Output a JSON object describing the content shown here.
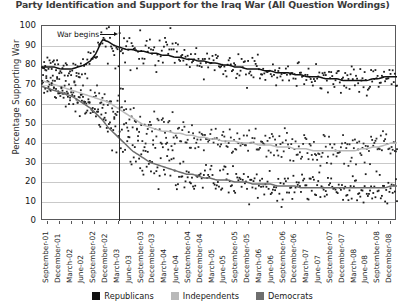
{
  "chart_data": {
    "type": "scatter",
    "title": "Party Identification and Support for the Iraq War (All Question Wordings)",
    "xlabel": "",
    "ylabel": "Percentage Supporting War",
    "ylim": [
      0,
      100
    ],
    "ytick_values": [
      0,
      10,
      20,
      30,
      40,
      50,
      60,
      70,
      80,
      90,
      100
    ],
    "grid": true,
    "legend_position": "bottom",
    "annotations": [
      {
        "text": "War begins",
        "x": "March-03",
        "note": "vertical line at March 2003 with left-pointing arrow label"
      }
    ],
    "xtick_labels": [
      "September-01",
      "December-01",
      "March-02",
      "June-02",
      "September-02",
      "December-02",
      "March-03",
      "June-03",
      "September-03",
      "December-03",
      "March-04",
      "June-04",
      "September-04",
      "December-04",
      "March-05",
      "June-05",
      "September-05",
      "December-05",
      "March-06",
      "June-06",
      "September-06",
      "December-06",
      "March-07",
      "June-07",
      "September-07",
      "December-07",
      "March-08",
      "June-08",
      "September-08",
      "December-08"
    ],
    "series": [
      {
        "name": "Republicans",
        "color": "#111111",
        "trend": [
          79,
          79,
          79,
          78,
          78,
          78,
          79,
          80,
          82,
          86,
          93,
          92,
          90,
          89,
          88,
          88,
          87,
          87,
          86,
          86,
          85,
          85,
          84,
          84,
          83,
          83,
          82,
          82,
          81,
          81,
          80,
          80,
          79,
          79,
          78,
          78,
          78,
          77,
          77,
          76,
          76,
          76,
          75,
          75,
          74,
          74,
          74,
          73,
          73,
          73,
          72,
          72,
          72,
          72,
          72,
          73,
          73,
          74,
          74,
          74
        ]
      },
      {
        "name": "Independents",
        "color": "#b9b9b9",
        "trend": [
          72,
          71,
          70,
          69,
          68,
          67,
          66,
          65,
          64,
          63,
          62,
          61,
          59,
          57,
          55,
          53,
          51,
          49,
          48,
          47,
          46,
          46,
          45,
          45,
          44,
          44,
          43,
          43,
          42,
          42,
          41,
          41,
          41,
          40,
          40,
          40,
          39,
          39,
          39,
          38,
          38,
          38,
          37,
          37,
          37,
          36,
          36,
          36,
          36,
          36,
          36,
          36,
          36,
          37,
          37,
          38,
          38,
          39,
          40,
          40
        ]
      },
      {
        "name": "Democrats",
        "color": "#6e6e6e",
        "trend": [
          69,
          68,
          67,
          66,
          65,
          64,
          62,
          60,
          58,
          55,
          52,
          48,
          45,
          42,
          39,
          36,
          34,
          32,
          30,
          29,
          28,
          27,
          26,
          25,
          24,
          24,
          23,
          22,
          22,
          21,
          21,
          21,
          20,
          20,
          20,
          19,
          19,
          19,
          19,
          18,
          18,
          18,
          18,
          17,
          17,
          17,
          17,
          17,
          17,
          17,
          17,
          17,
          17,
          17,
          17,
          17,
          17,
          17,
          18,
          18
        ]
      }
    ],
    "scatter_spread": {
      "Republicans": 6.5,
      "Independents": 8.5,
      "Democrats": 8.0
    }
  },
  "legend": {
    "items": [
      {
        "label": "Republicans",
        "color": "#111111"
      },
      {
        "label": "Independents",
        "color": "#b9b9b9"
      },
      {
        "label": "Democrats",
        "color": "#6e6e6e"
      }
    ]
  },
  "annotation": {
    "war_begins": "War begins"
  }
}
